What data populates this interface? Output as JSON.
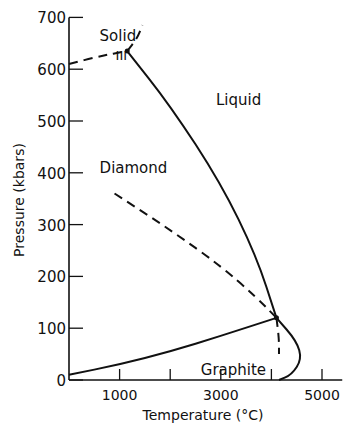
{
  "chart_data": {
    "type": "line",
    "title": "",
    "xlabel": "Temperature (°C)",
    "ylabel": "Pressure (kbars)",
    "xlim": [
      0,
      5400
    ],
    "ylim": [
      0,
      700
    ],
    "x_ticks": [
      1000,
      2000,
      3000,
      4000,
      5000
    ],
    "x_tick_labels": [
      "1000",
      "",
      "3000",
      "",
      "5000"
    ],
    "y_ticks": [
      0,
      100,
      200,
      300,
      400,
      500,
      600,
      700
    ],
    "y_tick_labels": [
      "0",
      "100",
      "200",
      "300",
      "400",
      "500",
      "600",
      "700"
    ],
    "grid": false,
    "regions": [
      {
        "label": "Solid",
        "sublabel": "III",
        "x": 1000,
        "y": 665
      },
      {
        "label": "Liquid",
        "x": 3300,
        "y": 540
      },
      {
        "label": "Diamond",
        "x": 1000,
        "y": 410
      },
      {
        "label": "Graphite",
        "x": 3000,
        "y": 20
      }
    ],
    "series": [
      {
        "name": "graphite-diamond boundary",
        "style": "solid",
        "points": [
          [
            0,
            10
          ],
          [
            1000,
            30
          ],
          [
            2000,
            55
          ],
          [
            3000,
            85
          ],
          [
            4100,
            120
          ]
        ]
      },
      {
        "name": "diamond-liquid melting curve",
        "style": "solid",
        "points": [
          [
            1150,
            635
          ],
          [
            2000,
            530
          ],
          [
            3000,
            380
          ],
          [
            3700,
            240
          ],
          [
            4100,
            120
          ]
        ]
      },
      {
        "name": "graphite-liquid melting curve",
        "style": "solid",
        "points": [
          [
            4100,
            120
          ],
          [
            4500,
            75
          ],
          [
            4600,
            40
          ],
          [
            4400,
            10
          ],
          [
            4150,
            0
          ]
        ]
      },
      {
        "name": "metastable graphite-diamond extension",
        "style": "dashed",
        "points": [
          [
            900,
            360
          ],
          [
            2000,
            290
          ],
          [
            3000,
            220
          ],
          [
            3700,
            160
          ],
          [
            4100,
            120
          ]
        ]
      },
      {
        "name": "metastable graphite melting extension",
        "style": "dashed",
        "points": [
          [
            4100,
            120
          ],
          [
            4150,
            80
          ],
          [
            4150,
            50
          ]
        ]
      },
      {
        "name": "solid III - diamond boundary",
        "style": "dashed",
        "points": [
          [
            0,
            610
          ],
          [
            600,
            625
          ],
          [
            1150,
            635
          ]
        ]
      },
      {
        "name": "solid III - liquid boundary",
        "style": "dashed",
        "points": [
          [
            1150,
            635
          ],
          [
            1350,
            660
          ],
          [
            1450,
            685
          ]
        ]
      }
    ],
    "triple_points": [
      [
        1150,
        635
      ],
      [
        4100,
        120
      ]
    ]
  }
}
